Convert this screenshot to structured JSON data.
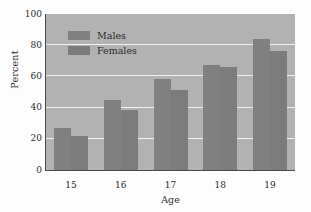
{
  "chart_data": {
    "type": "bar",
    "title": "",
    "xlabel": "Age",
    "ylabel": "Percent",
    "categories": [
      "15",
      "16",
      "17",
      "18",
      "19"
    ],
    "series": [
      {
        "name": "Males",
        "values": [
          27,
          45,
          58.5,
          67,
          84
        ]
      },
      {
        "name": "Females",
        "values": [
          22,
          38.5,
          51.5,
          66,
          76
        ]
      }
    ],
    "ylim": [
      0,
      100
    ],
    "yticks": [
      0,
      20,
      40,
      60,
      80,
      100
    ],
    "ytick_labels": [
      "0",
      "20",
      "40",
      "60",
      "80",
      "100"
    ],
    "grid": true,
    "grid_axis": "y",
    "legend_position": "upper left",
    "colors": {
      "males": "#808080",
      "females": "#7c7c7c",
      "panel_background": "#b2b2b2",
      "gridline": "#f2f2f2",
      "axis": "#4a4a4a",
      "text": "#2b2b2b",
      "figure_background": "#fdfdfd"
    }
  }
}
